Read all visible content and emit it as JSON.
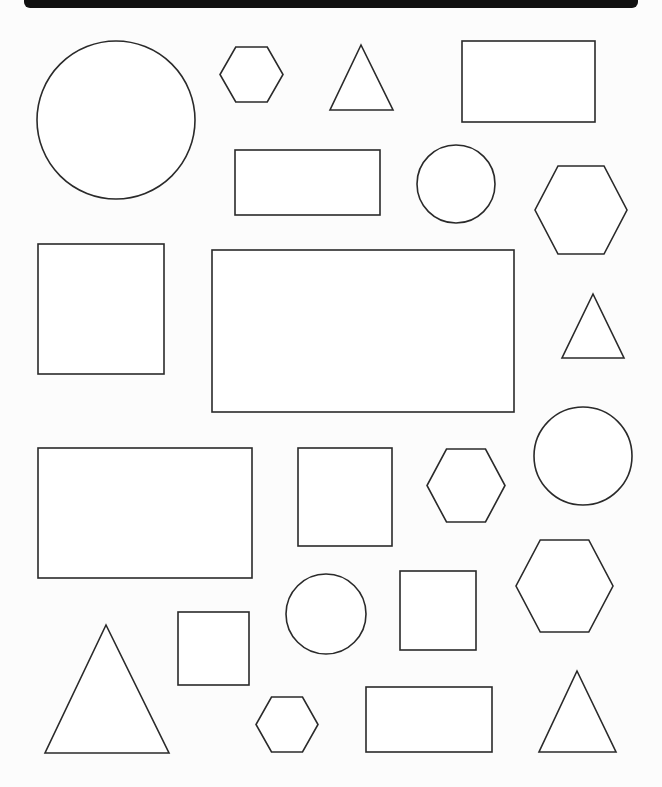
{
  "page": {
    "width": 662,
    "height": 787,
    "background": "#fcfcfc",
    "header_bar_color": "#111111",
    "stroke_color": "#2a2a2a",
    "fill_color": "#ffffff"
  },
  "shapes": [
    {
      "type": "circle",
      "cx": 116,
      "cy": 120,
      "r": 79
    },
    {
      "type": "hexagon",
      "x": 220,
      "y": 47,
      "w": 63,
      "h": 55
    },
    {
      "type": "triangle",
      "points": [
        [
          361,
          45
        ],
        [
          330,
          110
        ],
        [
          393,
          110
        ]
      ]
    },
    {
      "type": "rect",
      "x": 462,
      "y": 41,
      "w": 133,
      "h": 81
    },
    {
      "type": "rect",
      "x": 235,
      "y": 150,
      "w": 145,
      "h": 65
    },
    {
      "type": "circle",
      "cx": 456,
      "cy": 184,
      "r": 39
    },
    {
      "type": "hexagon",
      "x": 535,
      "y": 166,
      "w": 92,
      "h": 88
    },
    {
      "type": "rect",
      "x": 38,
      "y": 244,
      "w": 126,
      "h": 130
    },
    {
      "type": "rect",
      "x": 212,
      "y": 250,
      "w": 302,
      "h": 162
    },
    {
      "type": "triangle",
      "points": [
        [
          593,
          294
        ],
        [
          562,
          358
        ],
        [
          624,
          358
        ]
      ]
    },
    {
      "type": "rect",
      "x": 38,
      "y": 448,
      "w": 214,
      "h": 130
    },
    {
      "type": "rect",
      "x": 298,
      "y": 448,
      "w": 94,
      "h": 98
    },
    {
      "type": "hexagon",
      "x": 427,
      "y": 449,
      "w": 78,
      "h": 73
    },
    {
      "type": "circle",
      "cx": 583,
      "cy": 456,
      "r": 49
    },
    {
      "type": "hexagon",
      "x": 516,
      "y": 540,
      "w": 97,
      "h": 92
    },
    {
      "type": "circle",
      "cx": 326,
      "cy": 614,
      "r": 40
    },
    {
      "type": "rect",
      "x": 400,
      "y": 571,
      "w": 76,
      "h": 79
    },
    {
      "type": "rect",
      "x": 178,
      "y": 612,
      "w": 71,
      "h": 73
    },
    {
      "type": "triangle",
      "points": [
        [
          106,
          625
        ],
        [
          45,
          753
        ],
        [
          169,
          753
        ]
      ]
    },
    {
      "type": "hexagon",
      "x": 256,
      "y": 697,
      "w": 62,
      "h": 55
    },
    {
      "type": "rect",
      "x": 366,
      "y": 687,
      "w": 126,
      "h": 65
    },
    {
      "type": "triangle",
      "points": [
        [
          577,
          671
        ],
        [
          539,
          752
        ],
        [
          616,
          752
        ]
      ]
    }
  ],
  "summary": {
    "circles": 5,
    "hexagons": 5,
    "triangles": 4,
    "rectangles": 4,
    "squares": 4
  }
}
